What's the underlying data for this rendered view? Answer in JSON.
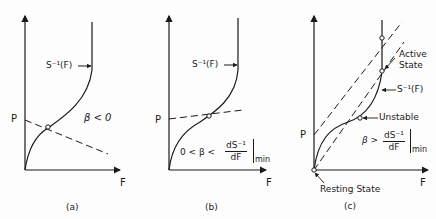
{
  "panels": [
    {
      "id": "a",
      "caption": "(a)",
      "y_label": "P",
      "x_label": "F",
      "curve_label": "S⁻¹(F)",
      "condition": "β < 0"
    },
    {
      "id": "b",
      "caption": "(b)",
      "y_label": "P",
      "x_label": "F",
      "curve_label": "S⁻¹(F)",
      "condition_prefix": "0 < β <",
      "frac_num": "dS⁻¹",
      "frac_den": "dF",
      "frac_sub": "min"
    },
    {
      "id": "c",
      "caption": "(c)",
      "y_label": "P",
      "x_label": "F",
      "curve_label": "S⁻¹(F)",
      "active_label_1": "Active",
      "active_label_2": "State",
      "unstable_label": "Unstable",
      "resting_label": "Resting  State",
      "condition_prefix": "β >",
      "frac_num": "dS⁻¹",
      "frac_den": "dF",
      "frac_sub": "min"
    }
  ],
  "colors": {
    "ink": "#1a1a1a",
    "background": "#fdfdfd"
  }
}
